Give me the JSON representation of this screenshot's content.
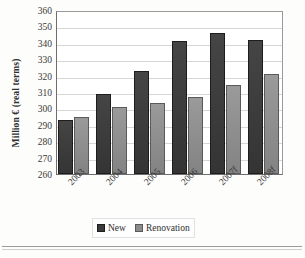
{
  "chart_data": {
    "type": "bar",
    "title": "",
    "xlabel": "",
    "ylabel": "Million € (real terms)",
    "categories": [
      "2003",
      "2004",
      "2005",
      "2006",
      "2007f",
      "2008f"
    ],
    "series": [
      {
        "name": "New",
        "color": "#3b3b3b",
        "values": [
          293,
          309,
          323,
          341,
          346,
          342
        ]
      },
      {
        "name": "Renovation",
        "color": "#8c8c8c",
        "values": [
          295,
          301,
          303,
          307,
          314,
          321
        ]
      }
    ],
    "ylim": [
      260,
      360
    ],
    "ytick_step": 10,
    "yticks": [
      360,
      350,
      340,
      330,
      320,
      310,
      300,
      290,
      280,
      270,
      260
    ],
    "grid": true,
    "legend_position": "bottom"
  },
  "legend": {
    "entries": [
      {
        "label": "New",
        "swatch": "dark-gray-swatch-icon"
      },
      {
        "label": "Renovation",
        "swatch": "medium-gray-swatch-icon"
      }
    ]
  },
  "colors": {
    "new": "#3b3b3b",
    "renovation": "#8c8c8c",
    "axis": "#6e6e6e",
    "gridline": "#d6d6d6",
    "background": "#ffffff"
  }
}
